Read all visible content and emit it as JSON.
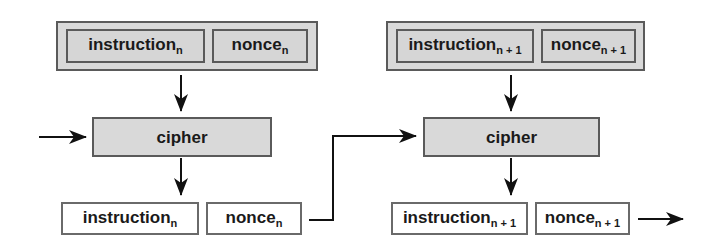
{
  "diagram": {
    "stage_n": {
      "input": {
        "instruction": {
          "text": "instruction",
          "subscript": "n"
        },
        "nonce": {
          "text": "nonce",
          "subscript": "n"
        }
      },
      "cipher": {
        "label": "cipher"
      },
      "output": {
        "instruction": {
          "text": "instruction",
          "subscript": "n"
        },
        "nonce": {
          "text": "nonce",
          "subscript": "n"
        }
      }
    },
    "stage_n_plus_1": {
      "input": {
        "instruction": {
          "text": "instruction",
          "subscript": "n + 1"
        },
        "nonce": {
          "text": "nonce",
          "subscript": "n + 1"
        }
      },
      "cipher": {
        "label": "cipher"
      },
      "output": {
        "instruction": {
          "text": "instruction",
          "subscript": "n + 1"
        },
        "nonce": {
          "text": "nonce",
          "subscript": "n + 1"
        }
      }
    },
    "connections": [
      {
        "from": "external-input",
        "to": "stage_n.cipher"
      },
      {
        "from": "stage_n.input",
        "to": "stage_n.cipher"
      },
      {
        "from": "stage_n.cipher",
        "to": "stage_n.output"
      },
      {
        "from": "stage_n.output.nonce",
        "to": "stage_n_plus_1.cipher"
      },
      {
        "from": "stage_n_plus_1.input",
        "to": "stage_n_plus_1.cipher"
      },
      {
        "from": "stage_n_plus_1.cipher",
        "to": "stage_n_plus_1.output"
      },
      {
        "from": "stage_n_plus_1.output.nonce",
        "to": "external-output"
      }
    ],
    "colors": {
      "box_fill": "#d9d9d9",
      "output_fill": "#ffffff",
      "stroke": "#1a1a1a",
      "border": "#5a5a5a"
    }
  }
}
